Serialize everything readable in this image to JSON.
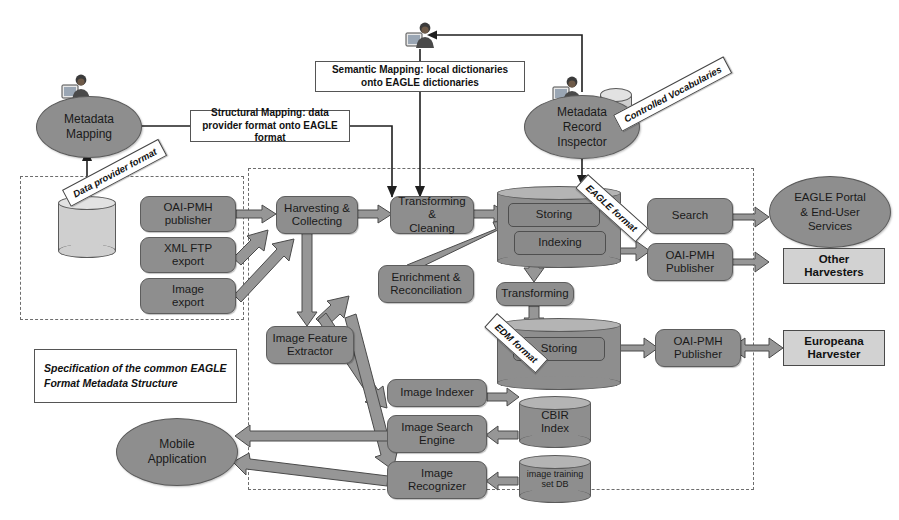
{
  "diagram": {
    "colors": {
      "node_fill": "#8e8e8e",
      "node_stroke": "#5a5a5a",
      "plain_fill": "#d2d2d2",
      "arrow_fill": "#969696",
      "dashed_stroke": "#6d6d6d",
      "background": "#ffffff"
    }
  },
  "actors": {
    "metadata_mapping": "Metadata\nMapping",
    "metadata_record_inspector": "Metadata\nRecord\nInspector",
    "mobile_application": "Mobile\nApplication",
    "eagle_portal": "EAGLE Portal\n& End-User\nServices"
  },
  "notes": {
    "semantic_mapping": "Semantic Mapping: local dictionaries onto EAGLE dictionaries",
    "structural_mapping": "Structural Mapping: data provider format onto EAGLE format",
    "specification": "Specification of the common EAGLE Format Metadata Structure"
  },
  "ribbons": {
    "data_provider_format": "Data provider format",
    "controlled_vocabularies": "Controlled Vocabularies",
    "eagle_format": "EAGLE format",
    "edm_format": "EDM format"
  },
  "provider_zone": {
    "database": "",
    "nodes": [
      {
        "id": "oai-pmh-publisher",
        "label": "OAI-PMH\npublisher"
      },
      {
        "id": "xml-ftp-export",
        "label": "XML FTP\nexport"
      },
      {
        "id": "image-export",
        "label": "Image\nexport"
      }
    ]
  },
  "pipeline": {
    "nodes": [
      {
        "id": "harvesting-collecting",
        "label": "Harvesting &\nCollecting"
      },
      {
        "id": "transforming-cleaning",
        "label": "Transforming &\nCleaning"
      },
      {
        "id": "enrichment-reconciliation",
        "label": "Enrichment &\nReconciliation"
      },
      {
        "id": "storing-eagle",
        "label": "Storing"
      },
      {
        "id": "indexing",
        "label": "Indexing"
      },
      {
        "id": "transforming",
        "label": "Transforming"
      },
      {
        "id": "storing-edm",
        "label": "Storing"
      },
      {
        "id": "image-feature-extractor",
        "label": "Image Feature\nExtractor"
      },
      {
        "id": "image-indexer",
        "label": "Image Indexer"
      },
      {
        "id": "image-search-engine",
        "label": "Image Search\nEngine"
      },
      {
        "id": "image-recognizer",
        "label": "Image\nRecognizer"
      }
    ]
  },
  "services": {
    "search": "Search",
    "oai_pmh_publisher_eagle": "OAI-PMH\nPublisher",
    "oai_pmh_publisher_edm": "OAI-PMH\nPublisher"
  },
  "consumers": {
    "other_harvesters": "Other\nHarvesters",
    "europeana_harvester": "Europeana\nHarvester"
  },
  "stores": {
    "cbir_index": "CBIR\nIndex",
    "image_training_set_db": "image training\nset DB"
  }
}
